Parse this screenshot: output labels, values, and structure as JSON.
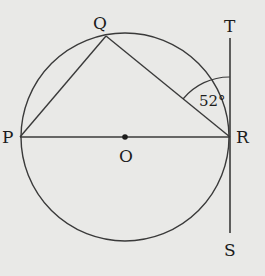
{
  "diagram": {
    "type": "circle-geometry",
    "points": {
      "P": {
        "label": "P",
        "x": 20,
        "y": 137
      },
      "Q": {
        "label": "Q",
        "x": 106,
        "y": 36
      },
      "R": {
        "label": "R",
        "x": 230,
        "y": 137
      },
      "O": {
        "label": "O",
        "x": 125,
        "y": 137
      },
      "T": {
        "label": "T",
        "x": 230,
        "y": 38
      },
      "S": {
        "label": "S",
        "x": 230,
        "y": 232
      }
    },
    "circle": {
      "center": "O",
      "radius": 105
    },
    "segments": [
      "PQ",
      "QR",
      "PR",
      "TS"
    ],
    "angle": {
      "vertex": "R",
      "between": [
        "Q",
        "T"
      ],
      "label": "52°"
    }
  },
  "labels": {
    "P": "P",
    "Q": "Q",
    "R": "R",
    "O": "O",
    "T": "T",
    "S": "S",
    "angle": "52°"
  }
}
